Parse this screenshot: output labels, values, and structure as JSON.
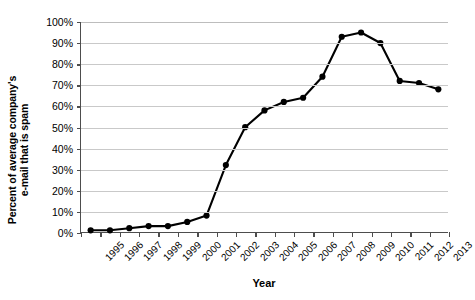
{
  "chart_data": {
    "type": "line",
    "title": "",
    "xlabel": "Year",
    "ylabel": "Percent of average company's e-mail that is spam",
    "ylabel_lines": [
      "Percent of average company's",
      "e-mail that is spam"
    ],
    "categories": [
      "1995",
      "1996",
      "1997",
      "1998",
      "1999",
      "2000",
      "2001",
      "2002",
      "2003",
      "2004",
      "2005",
      "2006",
      "2007",
      "2008",
      "2009",
      "2010",
      "2011",
      "2012",
      "2013"
    ],
    "values": [
      1,
      1,
      2,
      3,
      3,
      5,
      8,
      32,
      50,
      58,
      62,
      64,
      74,
      93,
      95,
      90,
      72,
      71,
      68
    ],
    "x": [
      "1995",
      "1996",
      "1997",
      "1998",
      "1999",
      "2000",
      "2001",
      "2002",
      "2003",
      "2004",
      "2005",
      "2006",
      "2007",
      "2008",
      "2009",
      "2010",
      "2011",
      "2012",
      "2013"
    ],
    "ylim": [
      0,
      100
    ],
    "ytick_values": [
      0,
      10,
      20,
      30,
      40,
      50,
      60,
      70,
      80,
      90,
      100
    ],
    "ytick_labels": [
      "0%",
      "10%",
      "20%",
      "30%",
      "40%",
      "50%",
      "60%",
      "70%",
      "80%",
      "90%",
      "100%"
    ],
    "grid": true,
    "legend": "none",
    "series": [
      {
        "name": "Percent of average company's e-mail that is spam",
        "values": [
          1,
          1,
          2,
          3,
          3,
          5,
          8,
          32,
          50,
          58,
          62,
          64,
          74,
          93,
          95,
          90,
          72,
          71,
          68
        ]
      }
    ],
    "marker": "circle",
    "line_color": "#000000",
    "marker_color": "#000000",
    "grid_color": "#c9c9c9",
    "axis_color": "#4d4d4d",
    "background_color": "#ffffff"
  }
}
